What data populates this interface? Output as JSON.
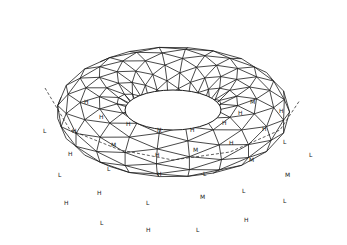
{
  "figure": {
    "stroke_color": "#1a1a1a",
    "background": "#ffffff",
    "center": [
      173,
      112
    ],
    "major_radius_x": 108,
    "major_radius_y": 58,
    "tube_radius_x": 57,
    "tube_radius_y": 52,
    "hole_radius_x": 48,
    "hole_radius_y": 20,
    "hidden_line": {
      "style": "dashed",
      "points": [
        [
          45,
          88
        ],
        [
          70,
          130
        ],
        [
          120,
          150
        ],
        [
          173,
          160
        ],
        [
          230,
          152
        ],
        [
          280,
          130
        ],
        [
          300,
          100
        ]
      ]
    },
    "labels": [
      {
        "text": "H",
        "x": 84,
        "y": 104
      },
      {
        "text": "H",
        "x": 99,
        "y": 119
      },
      {
        "text": "H",
        "x": 126,
        "y": 126
      },
      {
        "text": "H",
        "x": 157,
        "y": 132
      },
      {
        "text": "H",
        "x": 190,
        "y": 132
      },
      {
        "text": "H",
        "x": 222,
        "y": 125
      },
      {
        "text": "H",
        "x": 238,
        "y": 115
      },
      {
        "text": "M",
        "x": 250,
        "y": 104
      },
      {
        "text": "H",
        "x": 279,
        "y": 113
      },
      {
        "text": "L",
        "x": 43,
        "y": 133
      },
      {
        "text": "H",
        "x": 72,
        "y": 133
      },
      {
        "text": "H",
        "x": 68,
        "y": 156
      },
      {
        "text": "M",
        "x": 111,
        "y": 147
      },
      {
        "text": "H",
        "x": 155,
        "y": 157
      },
      {
        "text": "M",
        "x": 193,
        "y": 152
      },
      {
        "text": "H",
        "x": 229,
        "y": 145
      },
      {
        "text": "H",
        "x": 262,
        "y": 131
      },
      {
        "text": "L",
        "x": 283,
        "y": 144
      },
      {
        "text": "L",
        "x": 309,
        "y": 157
      },
      {
        "text": "L",
        "x": 107,
        "y": 171
      },
      {
        "text": "H",
        "x": 157,
        "y": 176
      },
      {
        "text": "L",
        "x": 203,
        "y": 176
      },
      {
        "text": "M",
        "x": 249,
        "y": 162
      },
      {
        "text": "M",
        "x": 285,
        "y": 177
      },
      {
        "text": "L",
        "x": 58,
        "y": 177
      },
      {
        "text": "H",
        "x": 97,
        "y": 195
      },
      {
        "text": "M",
        "x": 200,
        "y": 199
      },
      {
        "text": "L",
        "x": 242,
        "y": 193
      },
      {
        "text": "H",
        "x": 64,
        "y": 205
      },
      {
        "text": "L",
        "x": 146,
        "y": 205
      },
      {
        "text": "L",
        "x": 283,
        "y": 203
      },
      {
        "text": "L",
        "x": 100,
        "y": 225
      },
      {
        "text": "H",
        "x": 244,
        "y": 222
      },
      {
        "text": "H",
        "x": 146,
        "y": 232
      },
      {
        "text": "L",
        "x": 196,
        "y": 232
      }
    ]
  }
}
